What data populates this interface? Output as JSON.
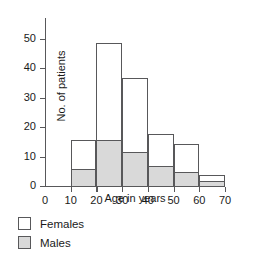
{
  "chart_data": {
    "type": "bar",
    "subtype": "stacked-histogram",
    "title": "",
    "xlabel": "Age in years",
    "ylabel": "No. of patients",
    "categories": [
      "10-20",
      "20-30",
      "30-40",
      "40-50",
      "50-60",
      "60-70"
    ],
    "bin_edges": [
      10,
      20,
      30,
      40,
      50,
      60,
      70
    ],
    "series": [
      {
        "name": "Males",
        "values": [
          6,
          16,
          12,
          7,
          5,
          2
        ],
        "color": "#d9d9d9"
      },
      {
        "name": "Females",
        "values": [
          10,
          33,
          25,
          11,
          9.5,
          2
        ],
        "color": "#ffffff"
      }
    ],
    "totals": [
      16,
      49,
      37,
      18,
      14.5,
      4
    ],
    "xlim": [
      0,
      70
    ],
    "ylim": [
      0,
      57
    ],
    "xticks": [
      0,
      10,
      20,
      30,
      40,
      50,
      60,
      70
    ],
    "yticks": [
      0,
      10,
      20,
      30,
      40,
      50
    ],
    "xtick_labels": [
      "0",
      "10",
      "20",
      "30",
      "40",
      "50",
      "60",
      "70"
    ],
    "ytick_labels": [
      "0",
      "10",
      "20",
      "30",
      "40",
      "50"
    ],
    "grid": false,
    "legend_position": "below-left",
    "legend": [
      {
        "label": "Females",
        "swatch": "white-square"
      },
      {
        "label": "Males",
        "swatch": "grey-square"
      }
    ]
  }
}
